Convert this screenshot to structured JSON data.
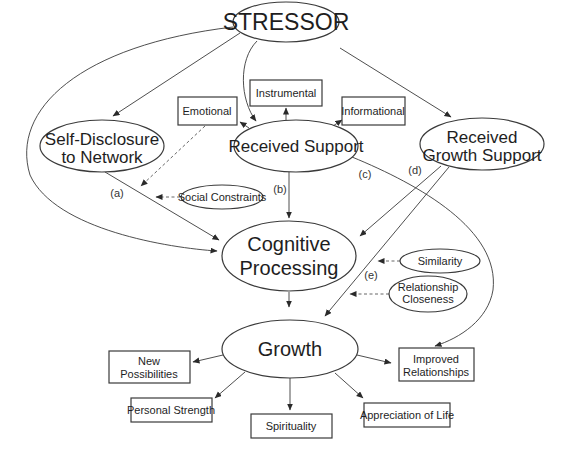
{
  "diagram": {
    "nodes": {
      "stressor": {
        "label": "STRESSOR",
        "shape": "ellipse"
      },
      "self_disclosure": {
        "line1": "Self-Disclosure",
        "line2": "to Network",
        "shape": "ellipse"
      },
      "received_support": {
        "label": "Received Support",
        "shape": "ellipse"
      },
      "received_growth_support": {
        "line1": "Received",
        "line2": "Growth Support",
        "shape": "ellipse"
      },
      "emotional": {
        "label": "Emotional",
        "shape": "box"
      },
      "instrumental": {
        "label": "Instrumental",
        "shape": "box"
      },
      "informational": {
        "label": "Informational",
        "shape": "box"
      },
      "social_constraints": {
        "label": "Social Constraints",
        "shape": "ellipse"
      },
      "cognitive_processing": {
        "line1": "Cognitive",
        "line2": "Processing",
        "shape": "ellipse"
      },
      "similarity": {
        "label": "Similarity",
        "shape": "ellipse"
      },
      "relationship_closeness": {
        "line1": "Relationship",
        "line2": "Closeness",
        "shape": "ellipse"
      },
      "growth": {
        "label": "Growth",
        "shape": "ellipse"
      },
      "new_possibilities": {
        "line1": "New",
        "line2": "Possibilities",
        "shape": "box"
      },
      "personal_strength": {
        "label": "Personal Strength",
        "shape": "box"
      },
      "spirituality": {
        "label": "Spirituality",
        "shape": "box"
      },
      "appreciation_of_life": {
        "label": "Appreciation of Life",
        "shape": "box"
      },
      "improved_relationships": {
        "line1": "Improved",
        "line2": "Relationships",
        "shape": "box"
      }
    },
    "path_labels": {
      "a": "(a)",
      "b": "(b)",
      "c": "(c)",
      "d": "(d)",
      "e": "(e)"
    },
    "edges": [
      {
        "from": "STRESSOR",
        "to": "Self-Disclosure to Network",
        "style": "solid"
      },
      {
        "from": "STRESSOR",
        "to": "Received Support",
        "style": "solid"
      },
      {
        "from": "STRESSOR",
        "to": "Received Growth Support",
        "style": "solid"
      },
      {
        "from": "STRESSOR",
        "to": "Cognitive Processing",
        "style": "solid"
      },
      {
        "from": "Received Support",
        "to": "Emotional",
        "style": "solid"
      },
      {
        "from": "Received Support",
        "to": "Instrumental",
        "style": "solid"
      },
      {
        "from": "Received Support",
        "to": "Informational",
        "style": "solid"
      },
      {
        "from": "Received Support",
        "to": "Cognitive Processing",
        "label": "(b)",
        "style": "solid"
      },
      {
        "from": "Received Support",
        "to": "Improved Relationships",
        "label": "(c)",
        "style": "solid"
      },
      {
        "from": "Self-Disclosure to Network",
        "to": "Cognitive Processing",
        "label": "(a)",
        "style": "solid"
      },
      {
        "from": "Emotional",
        "to": "path (a)",
        "style": "dashed"
      },
      {
        "from": "Social Constraints",
        "to": "path (a)",
        "style": "dashed"
      },
      {
        "from": "Received Growth Support",
        "to": "Cognitive Processing",
        "label": "(d)",
        "style": "solid"
      },
      {
        "from": "Received Growth Support",
        "to": "Growth",
        "label": "(e)",
        "style": "solid"
      },
      {
        "from": "Similarity",
        "to": "path (e)",
        "style": "dashed"
      },
      {
        "from": "Relationship Closeness",
        "to": "path (e)",
        "style": "dashed"
      },
      {
        "from": "Cognitive Processing",
        "to": "Growth",
        "style": "solid"
      },
      {
        "from": "Growth",
        "to": "New Possibilities",
        "style": "solid"
      },
      {
        "from": "Growth",
        "to": "Personal Strength",
        "style": "solid"
      },
      {
        "from": "Growth",
        "to": "Spirituality",
        "style": "solid"
      },
      {
        "from": "Growth",
        "to": "Appreciation of Life",
        "style": "solid"
      },
      {
        "from": "Growth",
        "to": "Improved Relationships",
        "style": "solid"
      }
    ]
  }
}
